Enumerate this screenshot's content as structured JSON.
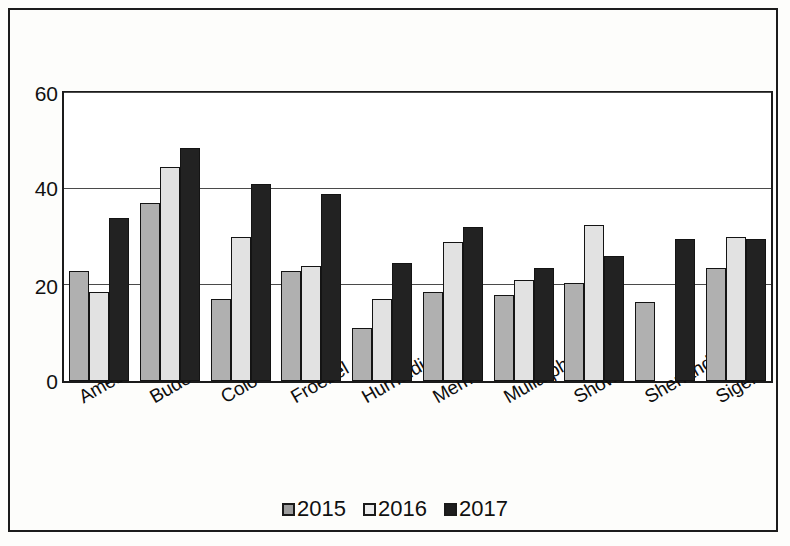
{
  "chart_data": {
    "type": "bar",
    "title": "",
    "subtitle": "",
    "xlabel": "",
    "ylabel": "",
    "ylim": [
      0,
      60
    ],
    "yticks": [
      0,
      20,
      40,
      60
    ],
    "ytick_labels": [
      "0",
      "20",
      "40",
      "60"
    ],
    "grid": true,
    "grid_axis": "y",
    "legend_position": "bottom",
    "orientation": "vertical",
    "categories": [
      "Ames",
      "Buder",
      "Colo",
      "Froebel",
      "Hurnoldi",
      "Mem",
      "Mullarphy",
      "Show",
      "Shenandeh",
      "Sigel"
    ],
    "series": [
      {
        "name": "2015",
        "color": "#b0b0b0",
        "values": [
          23,
          37,
          17,
          23,
          11,
          18.5,
          18,
          20.5,
          16.5,
          23.5
        ]
      },
      {
        "name": "2016",
        "color": "#e2e2e2",
        "values": [
          18.5,
          44.5,
          30,
          24,
          17,
          29,
          21,
          32.5,
          null,
          30
        ]
      },
      {
        "name": "2017",
        "color": "#222222",
        "values": [
          34,
          48.5,
          41,
          39,
          24.5,
          32,
          23.5,
          26,
          29.5,
          29.5
        ]
      }
    ]
  },
  "legend": {
    "entries": [
      {
        "label": "2015",
        "swatch": "legend-swatch-2015"
      },
      {
        "label": "2016",
        "swatch": "legend-swatch-2016"
      },
      {
        "label": "2017",
        "swatch": "legend-swatch-2017"
      }
    ]
  },
  "axes": {
    "y": {
      "ticks": [
        "60",
        "40",
        "20",
        "0"
      ]
    }
  },
  "colors": {
    "series_2015": "#b0b0b0",
    "series_2016": "#e2e2e2",
    "series_2017": "#222222",
    "frame": "#1c1c1c",
    "gridline": "#4a4a4a",
    "background": "#fdfdfb",
    "text": "#101010"
  }
}
